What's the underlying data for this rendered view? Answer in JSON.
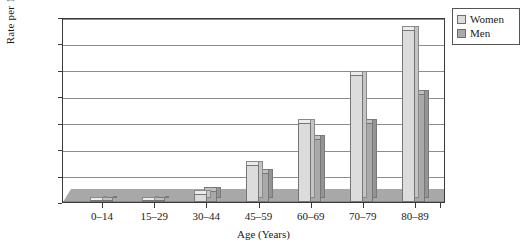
{
  "chart_data": {
    "type": "bar",
    "title": "",
    "xlabel": "Age (Years)",
    "ylabel": "Rate per 100,000",
    "categories": [
      "0–14",
      "15–29",
      "30–44",
      "45–59",
      "60–69",
      "70–79",
      "80–89"
    ],
    "series": [
      {
        "name": "Women",
        "color": "#dcdcdc",
        "values": [
          100,
          200,
          1500,
          7000,
          15000,
          24000,
          32500
        ]
      },
      {
        "name": "Men",
        "color": "#a9a9a9",
        "values": [
          150,
          250,
          2000,
          5500,
          12000,
          15000,
          20500
        ]
      }
    ],
    "ylim": [
      0,
      35000
    ],
    "yticks": [
      "0",
      "5000",
      "10000",
      "15000",
      "20000",
      "25000",
      "30000",
      "35000"
    ],
    "ytick_values": [
      0,
      5000,
      10000,
      15000,
      20000,
      25000,
      30000,
      35000
    ],
    "grid": "horizontal",
    "legend_position": "top-right",
    "style": "3d-column"
  },
  "legend": {
    "items": [
      {
        "label": "Women",
        "swatch": "women-swatch-icon"
      },
      {
        "label": "Men",
        "swatch": "men-swatch-icon"
      }
    ]
  }
}
